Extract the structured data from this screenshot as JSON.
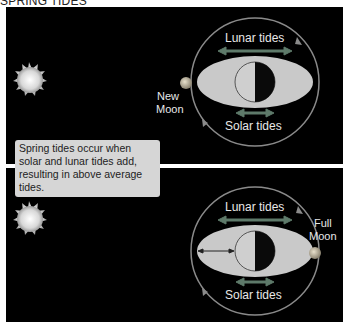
{
  "title": "SPRING TIDES",
  "caption": "Spring tides occur when solar and lunar tides add, resulting in above average tides.",
  "colors": {
    "background": "#000000",
    "orbit": "#8a8a8a",
    "earth_bulge": "#c9c9c9",
    "arrow": "#5e7a6a",
    "label": "#e8e8e8",
    "caption_bg": "#d6d6d6"
  },
  "panels": [
    {
      "name": "new-moon",
      "lunar_label": "Lunar tides",
      "solar_label": "Solar tides",
      "moon_label_line1": "New",
      "moon_label_line2": "Moon",
      "moon_position": "left"
    },
    {
      "name": "full-moon",
      "lunar_label": "Lunar tides",
      "solar_label": "Solar tides",
      "moon_label_line1": "Full",
      "moon_label_line2": "Moon",
      "moon_position": "right"
    }
  ]
}
